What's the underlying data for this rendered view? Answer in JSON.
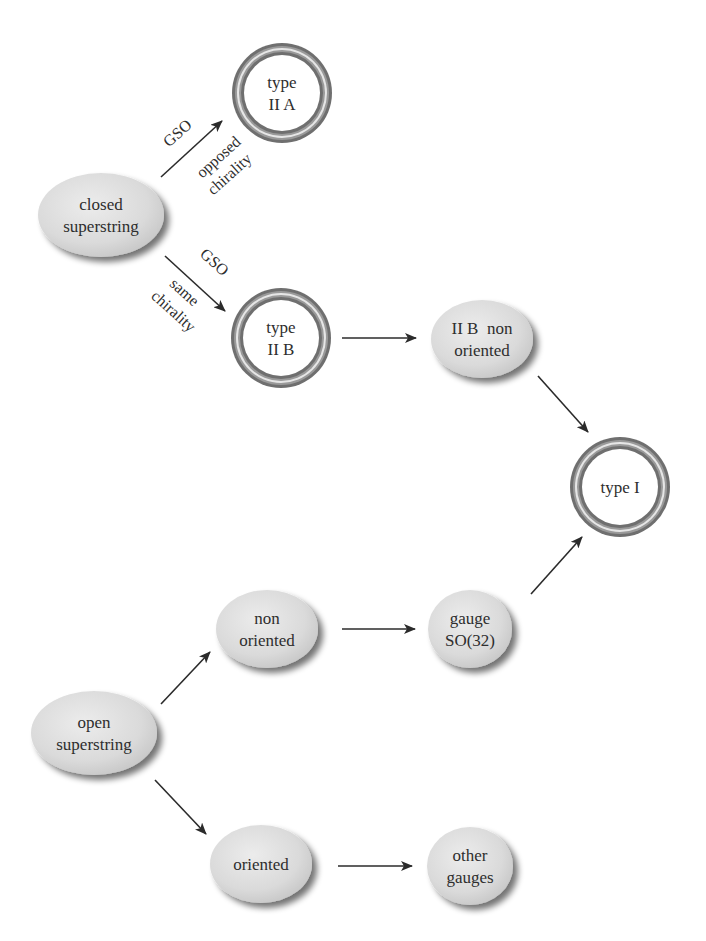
{
  "diagram": {
    "title": "",
    "colors": {
      "background": "#ffffff",
      "ellipse_fill": "#dcdcdc",
      "ellipse_shadow": "#8a8a8a",
      "ring_dark": "#6f6f6f",
      "ring_light": "#e6e6e6",
      "arrow": "#2b2b2b",
      "text": "#2e2e2e"
    },
    "nodes": [
      {
        "id": "closed_superstring",
        "shape": "ellipse",
        "lines": [
          "closed",
          "superstring"
        ],
        "cx": 101,
        "cy": 215,
        "rx": 63,
        "ry": 42
      },
      {
        "id": "type_IIA",
        "shape": "double-ring",
        "lines": [
          "type",
          "II A"
        ],
        "cx": 282,
        "cy": 93,
        "r": 50
      },
      {
        "id": "type_IIB",
        "shape": "double-ring",
        "lines": [
          "type",
          "II B"
        ],
        "cx": 281,
        "cy": 338,
        "r": 50
      },
      {
        "id": "IIB_non_oriented",
        "shape": "ellipse",
        "lines": [
          "II B  non",
          "oriented"
        ],
        "cx": 482,
        "cy": 339,
        "rx": 51,
        "ry": 39
      },
      {
        "id": "type_I",
        "shape": "double-ring",
        "lines": [
          "type I"
        ],
        "cx": 620,
        "cy": 487,
        "r": 50
      },
      {
        "id": "non_oriented",
        "shape": "ellipse",
        "lines": [
          "non",
          "oriented"
        ],
        "cx": 267,
        "cy": 629,
        "rx": 51,
        "ry": 39
      },
      {
        "id": "gauge_SO32",
        "shape": "ellipse",
        "lines": [
          "gauge",
          "SO(32)"
        ],
        "cx": 470,
        "cy": 629,
        "rx": 42,
        "ry": 39
      },
      {
        "id": "open_superstring",
        "shape": "ellipse",
        "lines": [
          "open",
          "superstring"
        ],
        "cx": 94,
        "cy": 733,
        "rx": 63,
        "ry": 42
      },
      {
        "id": "oriented",
        "shape": "ellipse",
        "lines": [
          "oriented"
        ],
        "cx": 261,
        "cy": 864,
        "rx": 51,
        "ry": 39
      },
      {
        "id": "other_gauges",
        "shape": "ellipse",
        "lines": [
          "other",
          "gauges"
        ],
        "cx": 470,
        "cy": 866,
        "rx": 43,
        "ry": 39
      }
    ],
    "edges": [
      {
        "from": "closed_superstring",
        "to": "type_IIA",
        "x1": 161,
        "y1": 177,
        "x2": 222,
        "y2": 121,
        "labels": [
          {
            "text": "GSO",
            "x": 181,
            "y": 137,
            "rotate": -42
          },
          {
            "text": "opposed",
            "x": 222,
            "y": 161,
            "rotate": -42
          },
          {
            "text": "chirality",
            "x": 233,
            "y": 178,
            "rotate": -42
          }
        ]
      },
      {
        "from": "closed_superstring",
        "to": "type_IIB",
        "x1": 165,
        "y1": 256,
        "x2": 225,
        "y2": 311,
        "labels": [
          {
            "text": "GSO",
            "x": 211,
            "y": 266,
            "rotate": 42
          },
          {
            "text": "same",
            "x": 181,
            "y": 296,
            "rotate": 42
          },
          {
            "text": "chirality",
            "x": 170,
            "y": 315,
            "rotate": 42
          }
        ]
      },
      {
        "from": "type_IIB",
        "to": "IIB_non_oriented",
        "x1": 342,
        "y1": 338,
        "x2": 416,
        "y2": 338,
        "labels": []
      },
      {
        "from": "IIB_non_oriented",
        "to": "type_I",
        "x1": 538,
        "y1": 376,
        "x2": 588,
        "y2": 432,
        "labels": []
      },
      {
        "from": "open_superstring",
        "to": "non_oriented",
        "x1": 161,
        "y1": 704,
        "x2": 210,
        "y2": 652,
        "labels": []
      },
      {
        "from": "open_superstring",
        "to": "oriented",
        "x1": 155,
        "y1": 780,
        "x2": 206,
        "y2": 834,
        "labels": []
      },
      {
        "from": "non_oriented",
        "to": "gauge_SO32",
        "x1": 342,
        "y1": 629,
        "x2": 415,
        "y2": 629,
        "labels": []
      },
      {
        "from": "gauge_SO32",
        "to": "type_I",
        "x1": 531,
        "y1": 594,
        "x2": 582,
        "y2": 537,
        "labels": []
      },
      {
        "from": "oriented",
        "to": "other_gauges",
        "x1": 338,
        "y1": 866,
        "x2": 412,
        "y2": 866,
        "labels": []
      }
    ]
  }
}
